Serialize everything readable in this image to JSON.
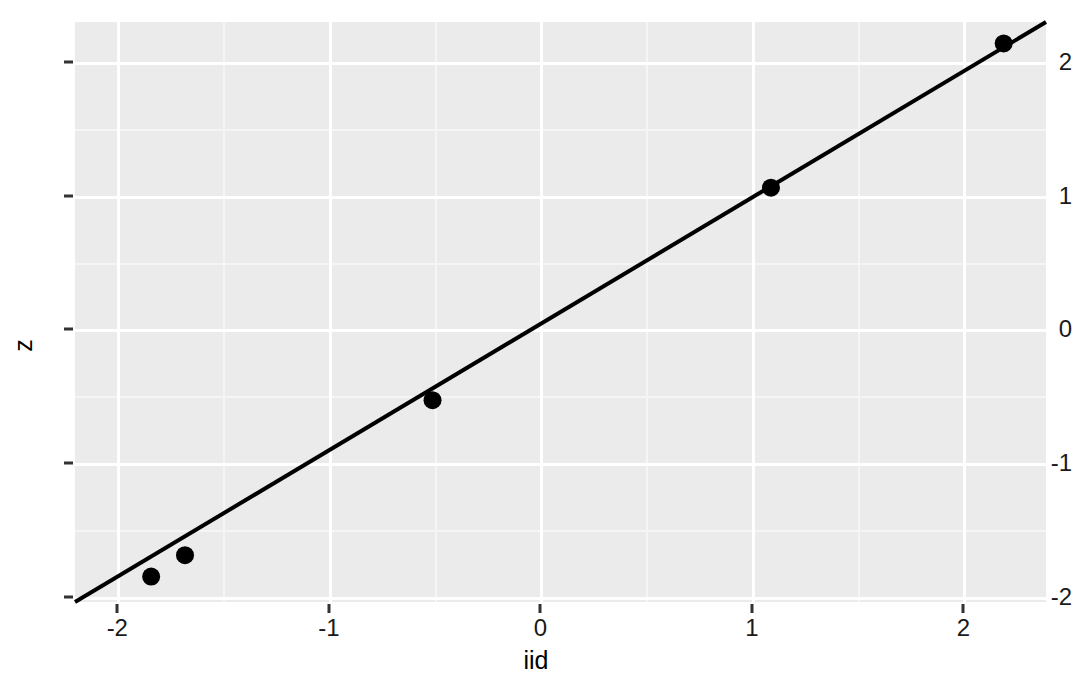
{
  "chart_data": {
    "type": "scatter",
    "title": "",
    "xlabel": "iid",
    "ylabel": "z",
    "xlim": [
      -2.2,
      2.39
    ],
    "ylim": [
      -2.04,
      2.3
    ],
    "xticks": [
      -2,
      -1,
      0,
      1,
      2
    ],
    "xticklabels": [
      "-2",
      "-1",
      "0",
      "1",
      "2"
    ],
    "yticks": [
      -2,
      -1,
      0,
      1,
      2
    ],
    "yticklabels": [
      "-2",
      "-1",
      "0",
      "1",
      "2"
    ],
    "grid": true,
    "grid_major": true,
    "grid_minor": true,
    "legend": "none",
    "panel_background": "#ebebeb",
    "grid_color": "#ffffff",
    "point_color": "#000000",
    "line_color": "#000000",
    "points": [
      {
        "x": -1.84,
        "y": -1.85
      },
      {
        "x": -1.68,
        "y": -1.69
      },
      {
        "x": -0.51,
        "y": -0.53
      },
      {
        "x": 1.09,
        "y": 1.06
      },
      {
        "x": 2.19,
        "y": 2.14
      }
    ],
    "reference_line": {
      "type": "line",
      "x": [
        -2.2,
        2.39
      ],
      "y": [
        -2.04,
        2.3
      ],
      "slope": 0.9475,
      "intercept": 0.0251
    },
    "series": [
      {
        "name": "points",
        "x": [
          -1.84,
          -1.68,
          -0.51,
          1.09,
          2.19
        ],
        "y": [
          -1.85,
          -1.69,
          -0.53,
          1.06,
          2.14
        ]
      }
    ]
  },
  "axes": {
    "x_title": "iid",
    "y_title": "z"
  }
}
